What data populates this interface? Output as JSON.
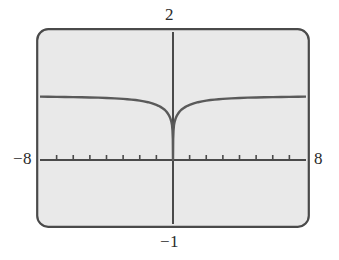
{
  "figure": {
    "kind": "graphing-calculator-screen",
    "screen_background": "#e9e9e9",
    "bezel_color": "#4a4a4a",
    "ink_color": "#5a5a5a",
    "axis_color": "#4a4a4a"
  },
  "labels": {
    "y_max": "2",
    "y_min": "−1",
    "x_min": "−8",
    "x_max": "8"
  },
  "chart_data": {
    "type": "line",
    "title": "",
    "xlabel": "",
    "ylabel": "",
    "xlim": [
      -8,
      8
    ],
    "ylim": [
      -1,
      2
    ],
    "xscl": 1,
    "yscl": 0,
    "grid": false,
    "legend": null,
    "annotations": [],
    "axis_ticks": {
      "x": [
        -8,
        -7,
        -6,
        -5,
        -4,
        -3,
        -2,
        -1,
        0,
        1,
        2,
        3,
        4,
        5,
        6,
        7,
        8
      ],
      "y": []
    },
    "series": [
      {
        "name": "y",
        "description": "cusp at origin touching y=0, rising steeply and flattening to horizontal asymptote y=1",
        "x": [
          -8.0,
          -7.5,
          -7.0,
          -6.5,
          -6.0,
          -5.5,
          -5.0,
          -4.5,
          -4.0,
          -3.5,
          -3.0,
          -2.75,
          -2.5,
          -2.25,
          -2.0,
          -1.75,
          -1.5,
          -1.25,
          -1.0,
          -0.875,
          -0.75,
          -0.625,
          -0.5,
          -0.4,
          -0.3,
          -0.25,
          -0.2,
          -0.15,
          -0.1,
          -0.06,
          -0.03,
          -0.01,
          0.0,
          0.01,
          0.03,
          0.06,
          0.1,
          0.15,
          0.2,
          0.25,
          0.3,
          0.4,
          0.5,
          0.625,
          0.75,
          0.875,
          1.0,
          1.25,
          1.5,
          1.75,
          2.0,
          2.25,
          2.5,
          2.75,
          3.0,
          3.5,
          4.0,
          4.5,
          5.0,
          5.5,
          6.0,
          6.5,
          7.0,
          7.5,
          8.0
        ],
        "y": [
          0.99,
          0.988,
          0.986,
          0.985,
          0.983,
          0.98,
          0.977,
          0.974,
          0.969,
          0.963,
          0.955,
          0.95,
          0.944,
          0.937,
          0.928,
          0.917,
          0.903,
          0.885,
          0.861,
          0.847,
          0.83,
          0.809,
          0.785,
          0.757,
          0.722,
          0.701,
          0.675,
          0.643,
          0.6,
          0.547,
          0.46,
          0.33,
          0.0,
          0.33,
          0.46,
          0.547,
          0.6,
          0.643,
          0.675,
          0.701,
          0.722,
          0.757,
          0.785,
          0.809,
          0.83,
          0.847,
          0.861,
          0.885,
          0.903,
          0.917,
          0.928,
          0.937,
          0.944,
          0.95,
          0.955,
          0.963,
          0.969,
          0.974,
          0.977,
          0.98,
          0.983,
          0.985,
          0.986,
          0.988,
          0.99
        ]
      }
    ]
  }
}
